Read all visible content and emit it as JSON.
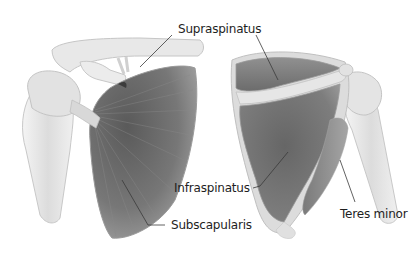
{
  "diagram": {
    "views": [
      {
        "id": "anterior",
        "muscles": [
          "Supraspinatus",
          "Subscapularis"
        ]
      },
      {
        "id": "posterior",
        "muscles": [
          "Supraspinatus",
          "Infraspinatus",
          "Teres minor"
        ]
      }
    ],
    "labels": {
      "supraspinatus": "Supraspinatus",
      "infraspinatus": "Infraspinatus",
      "subscapularis": "Subscapularis",
      "teres_minor": "Teres minor"
    },
    "colors": {
      "background": "#ffffff",
      "muscle_dark": "#6e6e6e",
      "muscle_mid": "#8c8c8c",
      "bone_light": "#e6e6e6",
      "bone_shadow": "#bdbdbd",
      "leader_line": "#3a3a3a",
      "label_text": "#1e1e1e"
    }
  }
}
